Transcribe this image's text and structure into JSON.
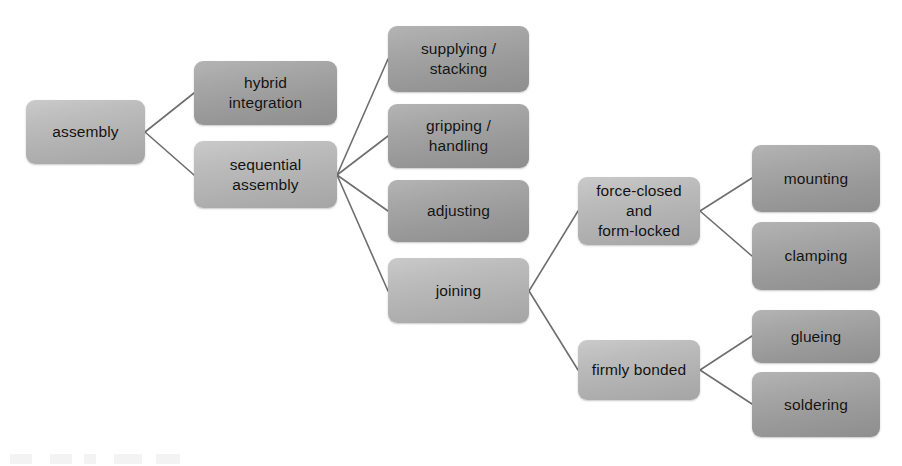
{
  "diagram": {
    "type": "tree",
    "background_color": "#ffffff",
    "node_fill_light": "#c8c8c8",
    "node_fill_dark": "#9a9a9a",
    "edge_color": "#6e6e6e",
    "text_color": "#111111",
    "nodes": [
      {
        "id": "assembly",
        "label": "assembly",
        "x": 26,
        "y": 100,
        "w": 119,
        "h": 64,
        "shade": "light"
      },
      {
        "id": "hybrid",
        "label": "hybrid\nintegration",
        "x": 194,
        "y": 61,
        "w": 143,
        "h": 64,
        "shade": "dark"
      },
      {
        "id": "sequential",
        "label": "sequential\nassembly",
        "x": 194,
        "y": 141,
        "w": 143,
        "h": 67,
        "shade": "light"
      },
      {
        "id": "supplying",
        "label": "supplying /\nstacking",
        "x": 388,
        "y": 26,
        "w": 141,
        "h": 66,
        "shade": "dark"
      },
      {
        "id": "gripping",
        "label": "gripping /\nhandling",
        "x": 388,
        "y": 104,
        "w": 141,
        "h": 64,
        "shade": "dark"
      },
      {
        "id": "adjusting",
        "label": "adjusting",
        "x": 388,
        "y": 180,
        "w": 141,
        "h": 62,
        "shade": "dark"
      },
      {
        "id": "joining",
        "label": "joining",
        "x": 388,
        "y": 258,
        "w": 141,
        "h": 65,
        "shade": "light"
      },
      {
        "id": "force_form",
        "label": "force-closed\nand\nform-locked",
        "x": 578,
        "y": 177,
        "w": 122,
        "h": 68,
        "shade": "light"
      },
      {
        "id": "firmly_bonded",
        "label": "firmly bonded",
        "x": 578,
        "y": 340,
        "w": 122,
        "h": 60,
        "shade": "light"
      },
      {
        "id": "mounting",
        "label": "mounting",
        "x": 752,
        "y": 145,
        "w": 128,
        "h": 67,
        "shade": "dark"
      },
      {
        "id": "clamping",
        "label": "clamping",
        "x": 752,
        "y": 222,
        "w": 128,
        "h": 68,
        "shade": "dark"
      },
      {
        "id": "glueing",
        "label": "glueing",
        "x": 752,
        "y": 310,
        "w": 128,
        "h": 53,
        "shade": "dark"
      },
      {
        "id": "soldering",
        "label": "soldering",
        "x": 752,
        "y": 372,
        "w": 128,
        "h": 65,
        "shade": "dark"
      }
    ],
    "edges": [
      {
        "from": "assembly",
        "to": "hybrid",
        "x1": 145,
        "y1": 132,
        "x2": 194,
        "y2": 93
      },
      {
        "from": "assembly",
        "to": "sequential",
        "x1": 145,
        "y1": 132,
        "x2": 194,
        "y2": 175
      },
      {
        "from": "sequential",
        "to": "supplying",
        "x1": 337,
        "y1": 175,
        "x2": 388,
        "y2": 59
      },
      {
        "from": "sequential",
        "to": "gripping",
        "x1": 337,
        "y1": 175,
        "x2": 388,
        "y2": 136
      },
      {
        "from": "sequential",
        "to": "adjusting",
        "x1": 337,
        "y1": 175,
        "x2": 388,
        "y2": 211
      },
      {
        "from": "sequential",
        "to": "joining",
        "x1": 337,
        "y1": 175,
        "x2": 388,
        "y2": 291
      },
      {
        "from": "joining",
        "to": "force_form",
        "x1": 529,
        "y1": 291,
        "x2": 578,
        "y2": 211
      },
      {
        "from": "joining",
        "to": "firmly_bonded",
        "x1": 529,
        "y1": 291,
        "x2": 578,
        "y2": 370
      },
      {
        "from": "force_form",
        "to": "mounting",
        "x1": 700,
        "y1": 211,
        "x2": 752,
        "y2": 178
      },
      {
        "from": "force_form",
        "to": "clamping",
        "x1": 700,
        "y1": 211,
        "x2": 752,
        "y2": 256
      },
      {
        "from": "firmly_bonded",
        "to": "glueing",
        "x1": 700,
        "y1": 370,
        "x2": 752,
        "y2": 336
      },
      {
        "from": "firmly_bonded",
        "to": "soldering",
        "x1": 700,
        "y1": 370,
        "x2": 752,
        "y2": 404
      }
    ]
  }
}
